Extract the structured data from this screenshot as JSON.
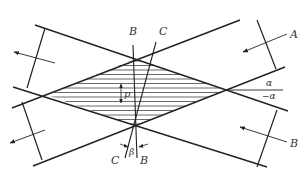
{
  "diagram": {
    "labels": {
      "beam_a": "A",
      "beam_b_right": "B",
      "line_b_top": "B",
      "line_c_top": "C",
      "line_b_bottom": "B",
      "line_c_bottom": "C",
      "angle_beta": "β",
      "angle_alpha": "α",
      "angle_neg_alpha": "−α",
      "fringe_period": "p"
    },
    "colors": {
      "stroke": "#222222",
      "hatch": "#444444",
      "text": "#333333",
      "background": "#ffffff"
    },
    "rhombus_vertices": {
      "top": [
        135,
        59
      ],
      "right": [
        227,
        90
      ],
      "bottom": [
        135,
        126
      ],
      "left": [
        47,
        95
      ]
    }
  }
}
